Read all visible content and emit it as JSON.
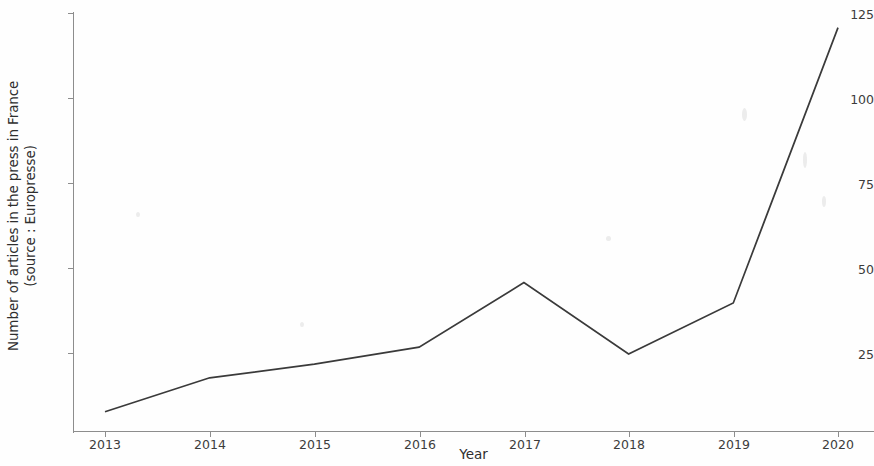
{
  "chart_data": {
    "type": "line",
    "title": "",
    "xlabel": "Year",
    "ylabel": "Number of articles in the press in France\n(source : Europresse)",
    "ylabel_line1": "Number of articles in the press in France",
    "ylabel_line2": "(source : Europresse)",
    "categories": [
      "2013",
      "2014",
      "2015",
      "2016",
      "2017",
      "2018",
      "2019",
      "2020"
    ],
    "x": [
      2013,
      2014,
      2015,
      2016,
      2017,
      2018,
      2019,
      2020
    ],
    "values": [
      8,
      18,
      22,
      27,
      46,
      25,
      40,
      121
    ],
    "series": [
      {
        "name": "Number of articles in the press in France",
        "values": [
          8,
          18,
          22,
          27,
          46,
          25,
          40,
          121
        ]
      }
    ],
    "ylim": [
      0,
      128
    ],
    "xlim": [
      2012.7,
      2020.3
    ],
    "yticks": [
      25,
      50,
      75,
      100,
      125
    ],
    "ytick_labels": [
      "25",
      "50",
      "75",
      "100",
      "125"
    ],
    "xticks": [
      2013,
      2014,
      2015,
      2016,
      2017,
      2018,
      2019,
      2020
    ],
    "xtick_labels": [
      "2013",
      "2014",
      "2015",
      "2016",
      "2017",
      "2018",
      "2019",
      "2020"
    ],
    "grid": false,
    "legend": false,
    "legend_position": "none",
    "line_color": "#3a3a3a",
    "axis_color": "#8d8d8d",
    "background_color": "#fefefe",
    "markers": false,
    "annotations": []
  }
}
